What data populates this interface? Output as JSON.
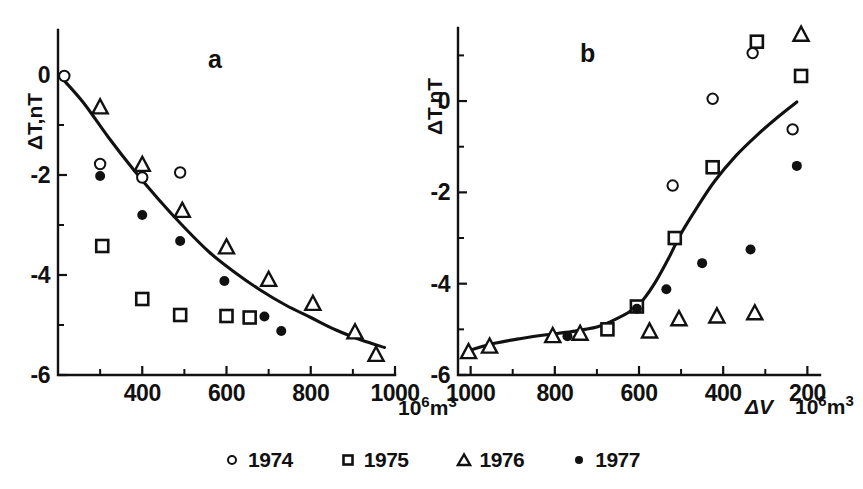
{
  "figure": {
    "panel_a_letter": "a",
    "panel_b_letter": "b",
    "y_axis_title": "ΔT,nT",
    "x_axis_units": "10⁶m³",
    "x_axis_var": "ΔV",
    "ink_color": "#111111"
  },
  "legend": {
    "items": [
      {
        "symbol": "open-circle",
        "label": "1974"
      },
      {
        "symbol": "open-square",
        "label": "1975"
      },
      {
        "symbol": "open-triangle",
        "label": "1976"
      },
      {
        "symbol": "filled-circle",
        "label": "1977"
      }
    ]
  },
  "chart_data": [
    {
      "id": "panel-a",
      "type": "scatter",
      "title": "a",
      "xlabel": "10⁶m³",
      "ylabel": "ΔT,nT",
      "xlim": [
        200,
        1000
      ],
      "ylim": [
        -6,
        0.9
      ],
      "x_ticks_major": [
        400,
        600,
        800,
        1000
      ],
      "x_ticks_minor": [
        300,
        500,
        700,
        900
      ],
      "y_ticks_major": [
        0,
        -2,
        -4,
        -6
      ],
      "y_ticks_minor": [
        -1,
        -3,
        -5
      ],
      "x_reversed": false,
      "grid": false,
      "legend_position": "below-figure",
      "fit_curve": {
        "label": "trend",
        "points": [
          [
            208,
            -0.05
          ],
          [
            260,
            -0.55
          ],
          [
            320,
            -1.25
          ],
          [
            380,
            -1.9
          ],
          [
            440,
            -2.5
          ],
          [
            500,
            -3.05
          ],
          [
            560,
            -3.55
          ],
          [
            620,
            -3.95
          ],
          [
            680,
            -4.3
          ],
          [
            740,
            -4.6
          ],
          [
            800,
            -4.85
          ],
          [
            860,
            -5.1
          ],
          [
            920,
            -5.3
          ],
          [
            975,
            -5.45
          ]
        ]
      },
      "series": [
        {
          "name": "1974",
          "symbol": "open-circle",
          "points": [
            [
              215,
              -0.02
            ],
            [
              300,
              -1.78
            ],
            [
              400,
              -2.05
            ],
            [
              490,
              -1.95
            ]
          ]
        },
        {
          "name": "1975",
          "symbol": "open-square",
          "points": [
            [
              305,
              -3.42
            ],
            [
              400,
              -4.48
            ],
            [
              490,
              -4.8
            ],
            [
              600,
              -4.82
            ],
            [
              655,
              -4.85
            ]
          ]
        },
        {
          "name": "1976",
          "symbol": "open-triangle",
          "points": [
            [
              300,
              -0.65
            ],
            [
              400,
              -1.8
            ],
            [
              495,
              -2.72
            ],
            [
              600,
              -3.45
            ],
            [
              700,
              -4.1
            ],
            [
              805,
              -4.58
            ],
            [
              905,
              -5.15
            ],
            [
              955,
              -5.6
            ]
          ]
        },
        {
          "name": "1977",
          "symbol": "filled-circle",
          "points": [
            [
              300,
              -2.02
            ],
            [
              400,
              -2.8
            ],
            [
              490,
              -3.32
            ],
            [
              595,
              -4.12
            ],
            [
              690,
              -4.83
            ],
            [
              730,
              -5.12
            ]
          ]
        }
      ]
    },
    {
      "id": "panel-b",
      "type": "scatter",
      "title": "b",
      "xlabel": "ΔV  10⁶m³",
      "ylabel": "ΔT,nT",
      "xlim": [
        1030,
        170
      ],
      "ylim": [
        -6,
        1.6
      ],
      "x_ticks_major": [
        1000,
        800,
        600,
        400,
        200
      ],
      "x_ticks_minor": [
        900,
        700,
        500,
        300
      ],
      "y_ticks_major": [
        0,
        -2,
        -4,
        -6
      ],
      "y_ticks_minor": [
        1,
        -1,
        -3,
        -5
      ],
      "x_reversed": true,
      "grid": false,
      "legend_position": "below-figure",
      "fit_curve": {
        "label": "trend",
        "points": [
          [
            1000,
            -5.45
          ],
          [
            940,
            -5.3
          ],
          [
            880,
            -5.2
          ],
          [
            820,
            -5.12
          ],
          [
            760,
            -5.05
          ],
          [
            700,
            -4.95
          ],
          [
            660,
            -4.8
          ],
          [
            620,
            -4.6
          ],
          [
            590,
            -4.35
          ],
          [
            560,
            -3.95
          ],
          [
            530,
            -3.45
          ],
          [
            500,
            -2.9
          ],
          [
            460,
            -2.3
          ],
          [
            420,
            -1.75
          ],
          [
            370,
            -1.2
          ],
          [
            320,
            -0.75
          ],
          [
            270,
            -0.35
          ],
          [
            225,
            -0.02
          ]
        ]
      },
      "series": [
        {
          "name": "1974",
          "symbol": "open-circle",
          "points": [
            [
              520,
              -1.85
            ],
            [
              425,
              0.05
            ],
            [
              330,
              1.05
            ],
            [
              235,
              -0.62
            ]
          ]
        },
        {
          "name": "1975",
          "symbol": "open-square",
          "points": [
            [
              675,
              -5.0
            ],
            [
              605,
              -4.5
            ],
            [
              515,
              -3.0
            ],
            [
              425,
              -1.45
            ],
            [
              320,
              1.3
            ],
            [
              215,
              0.55
            ]
          ]
        },
        {
          "name": "1976",
          "symbol": "open-triangle",
          "points": [
            [
              1005,
              -5.5
            ],
            [
              955,
              -5.38
            ],
            [
              805,
              -5.15
            ],
            [
              740,
              -5.1
            ],
            [
              575,
              -5.05
            ],
            [
              505,
              -4.78
            ],
            [
              415,
              -4.72
            ],
            [
              325,
              -4.65
            ],
            [
              215,
              1.45
            ]
          ]
        },
        {
          "name": "1977",
          "symbol": "filled-circle",
          "points": [
            [
              770,
              -5.15
            ],
            [
              605,
              -4.55
            ],
            [
              535,
              -4.12
            ],
            [
              450,
              -3.55
            ],
            [
              335,
              -3.25
            ],
            [
              225,
              -1.42
            ]
          ]
        }
      ]
    }
  ]
}
